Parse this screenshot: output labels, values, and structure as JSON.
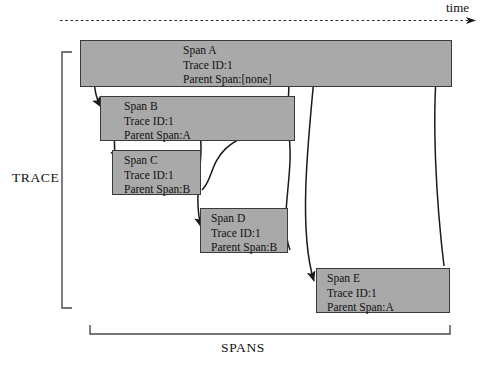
{
  "diagram": {
    "title_axis": "time",
    "trace_label": "TRACE",
    "spans_label": "SPANS",
    "colors": {
      "span_fill": "#a9a9a9",
      "span_stroke": "#3a3a3a",
      "arrow": "#1a1a1a",
      "background": "#ffffff",
      "text": "#111111"
    },
    "spans": [
      {
        "id": "A",
        "name": "Span A",
        "trace_id": "Trace ID:1",
        "parent": "Parent Span:[none]",
        "x": 80,
        "y": 40,
        "w": 372,
        "h": 47,
        "text_x": 100,
        "text_y": 2
      },
      {
        "id": "B",
        "name": "Span B",
        "trace_id": "Trace ID:1",
        "parent": "Parent Span:A",
        "x": 100,
        "y": 96,
        "w": 195,
        "h": 45,
        "text_x": 21,
        "text_y": 2
      },
      {
        "id": "C",
        "name": "Span C",
        "trace_id": "Trace ID:1",
        "parent": "Parent Span:B",
        "x": 112,
        "y": 150,
        "w": 89,
        "h": 45,
        "text_x": 9,
        "text_y": 2
      },
      {
        "id": "D",
        "name": "Span D",
        "trace_id": "Trace ID:1",
        "parent": "Parent Span:B",
        "x": 200,
        "y": 208,
        "w": 88,
        "h": 45,
        "text_x": 8,
        "text_y": 2
      },
      {
        "id": "E",
        "name": "Span E",
        "trace_id": "Trace ID:1",
        "parent": "Parent Span:A",
        "x": 316,
        "y": 268,
        "w": 134,
        "h": 45,
        "text_x": 8,
        "text_y": 2
      }
    ],
    "relations": [
      {
        "name": "a-to-b",
        "from": "Span A",
        "to": "Span B"
      },
      {
        "name": "b-to-a",
        "from": "Span B",
        "to": "Span A"
      },
      {
        "name": "b-to-c",
        "from": "Span B",
        "to": "Span C"
      },
      {
        "name": "c-to-b",
        "from": "Span C",
        "to": "Span B"
      },
      {
        "name": "b-to-d",
        "from": "Span B",
        "to": "Span D"
      },
      {
        "name": "d-to-b",
        "from": "Span D",
        "to": "Span B"
      },
      {
        "name": "a-to-e",
        "from": "Span A",
        "to": "Span E"
      },
      {
        "name": "e-to-a",
        "from": "Span E",
        "to": "Span A"
      }
    ]
  }
}
